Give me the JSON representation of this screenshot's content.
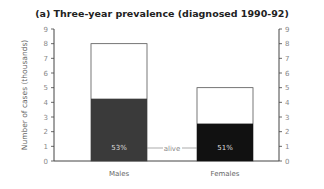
{
  "title": "(a) Three-year prevalence (diagnosed 1990-92)",
  "chart_data": {
    "type": "bar",
    "stacked": true,
    "title": "(a) Three-year prevalence (diagnosed 1990-92)",
    "xlabel": "",
    "ylabel": "Number of cases (thousands)",
    "ylim": [
      0,
      9
    ],
    "yticks": [
      0,
      1,
      2,
      3,
      4,
      5,
      6,
      7,
      8,
      9
    ],
    "right_axis_ticks": [
      0,
      1,
      2,
      3,
      4,
      5,
      6,
      7,
      8,
      9
    ],
    "categories": [
      "Males",
      "Females"
    ],
    "series": [
      {
        "name": "alive",
        "values": [
          4.25,
          2.55
        ],
        "color": "#333333"
      },
      {
        "name": "other",
        "values": [
          3.75,
          2.45
        ],
        "color": "#ffffff"
      }
    ],
    "totals": [
      8.0,
      5.0
    ],
    "bar_labels": [
      "53%",
      "51%"
    ],
    "annotation": "alive",
    "grid": false,
    "legend": "none"
  }
}
